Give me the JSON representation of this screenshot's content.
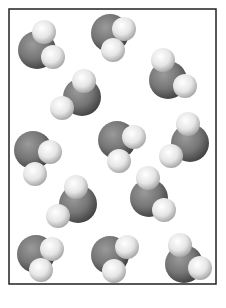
{
  "diagram": {
    "molecule_type": "H2O",
    "molecule_count": 12,
    "colors": {
      "oxygen": "#6e6e6e",
      "hydrogen": "#e4e4e4",
      "container_border": "#222222",
      "background": "#ffffff"
    }
  }
}
